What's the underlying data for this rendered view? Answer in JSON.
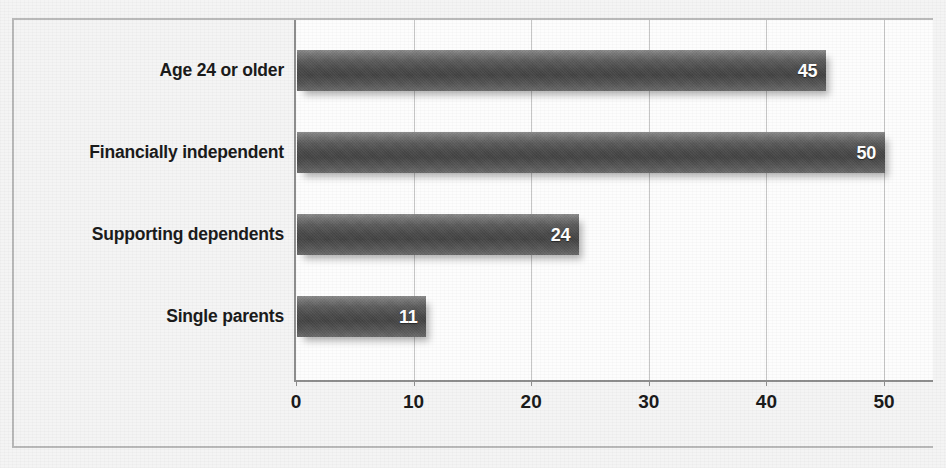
{
  "chart_data": {
    "type": "bar",
    "orientation": "horizontal",
    "title": "",
    "xlabel": "",
    "ylabel": "",
    "categories": [
      "Age 24 or older",
      "Financially independent",
      "Supporting dependents",
      "Single parents"
    ],
    "values": [
      45,
      50,
      24,
      11
    ],
    "value_labels": [
      "45",
      "50",
      "24",
      "11"
    ],
    "xlim": [
      0,
      50
    ],
    "xticks": [
      0,
      10,
      20,
      30,
      40,
      50
    ],
    "xtick_labels": [
      "0",
      "10",
      "20",
      "30",
      "40",
      "50"
    ],
    "grid": true,
    "grid_axis": "x",
    "legend": false,
    "legend_position": "none",
    "bar_color": "#4a4a4a",
    "bar_highlight_color": "#8d8d8d",
    "value_label_color": "#ffffff",
    "plot_background": "#fdfdfd",
    "figure_background": "#f4f4f4",
    "gridline_color": "#c6c6c6",
    "axis_color": "#8e8e8e",
    "text_color": "#1b1b1b"
  }
}
